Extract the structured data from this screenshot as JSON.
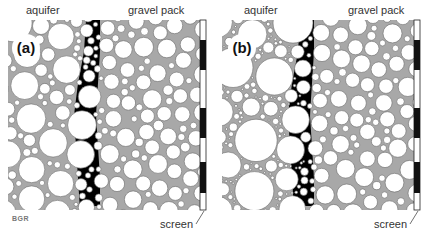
{
  "figure": {
    "panels": [
      {
        "id": "a",
        "tag": "(a)",
        "label_aquifer": "aquifer",
        "label_gravel": "gravel pack",
        "label_screen": "screen",
        "fine_fill": false,
        "seed": 11
      },
      {
        "id": "b",
        "tag": "(b)",
        "label_aquifer": "aquifer",
        "label_gravel": "gravel pack",
        "label_screen": "screen",
        "fine_fill": true,
        "seed": 29
      }
    ],
    "logo": "BGR"
  },
  "colors": {
    "pore_gray": "#a8a8a8",
    "grain": "#ffffff",
    "grain_edge": "#6a6a6a",
    "band": "#000000",
    "screen_black": "#111111",
    "screen_white": "#ffffff"
  },
  "layout": {
    "region": {
      "x": 8,
      "y": 20,
      "w": 192,
      "h": 190
    },
    "screen": {
      "x": 200,
      "w": 6,
      "segments_black": [
        [
          40,
          70
        ],
        [
          108,
          138
        ],
        [
          162,
          193
        ]
      ]
    },
    "band_path": [
      [
        86,
        100
      ],
      [
        84,
        100
      ],
      [
        78,
        98
      ],
      [
        74,
        96
      ],
      [
        76,
        98
      ],
      [
        78,
        100
      ],
      [
        80,
        100
      ]
    ]
  }
}
